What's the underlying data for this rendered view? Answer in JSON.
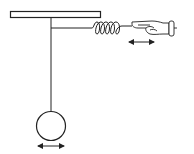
{
  "diagram": {
    "title": "",
    "elements": {
      "ceiling": {
        "label": ""
      },
      "string": {
        "label": ""
      },
      "rod": {
        "label": ""
      },
      "spring": {
        "label": "",
        "coils": 5
      },
      "hand": {
        "label": ""
      },
      "bob": {
        "label": ""
      },
      "hand_motion_arrow": {
        "label": ""
      },
      "bob_motion_arrow": {
        "label": ""
      }
    },
    "colors": {
      "stroke": "#222222",
      "background": "#ffffff"
    }
  }
}
